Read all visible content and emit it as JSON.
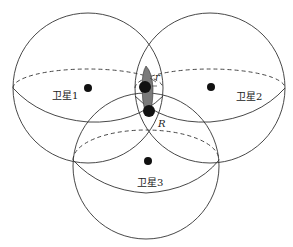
{
  "diagram": {
    "satellites": [
      {
        "label": "卫星1",
        "cx": 88,
        "cy": 88,
        "r": 75,
        "dot": [
          88,
          88
        ],
        "label_pos": [
          52,
          99
        ],
        "eq_ry_top": 19,
        "eq_ry_bottom": 34
      },
      {
        "label": "卫星2",
        "cx": 210,
        "cy": 88,
        "r": 75,
        "dot": [
          211,
          87
        ],
        "label_pos": [
          236,
          100
        ],
        "eq_ry_top": 19,
        "eq_ry_bottom": 34
      },
      {
        "label": "卫星3",
        "cx": 146,
        "cy": 166,
        "r": 73,
        "dot": [
          148,
          161
        ],
        "label_pos": [
          137,
          186
        ],
        "eq_ry_top": 28,
        "eq_ry_bottom": 35
      }
    ],
    "annotations": {
      "small_r": "r",
      "big_r": "R"
    },
    "intersection_points": [
      [
        145,
        87
      ],
      [
        149,
        111
      ]
    ],
    "colors": {
      "line": "#333333",
      "dot": "#111111",
      "lens_fill": "#7a7a7a"
    }
  }
}
